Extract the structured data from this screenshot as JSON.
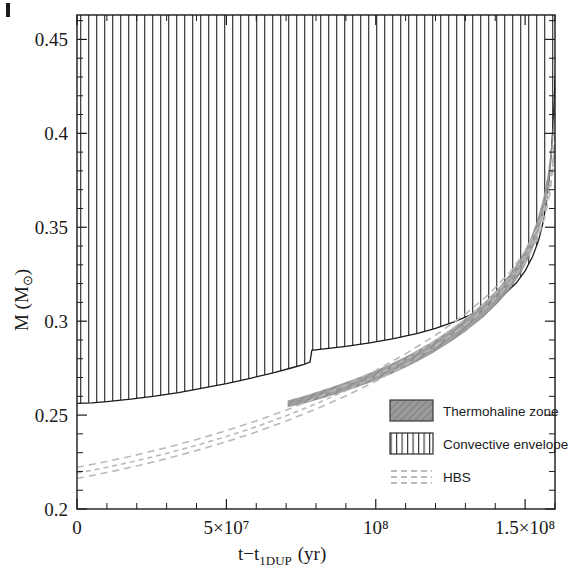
{
  "chart_data": {
    "type": "area",
    "title": "",
    "xlabel": "t-t_1DUP (yr)",
    "ylabel": "M (M_sun)",
    "xlim": [
      0,
      160000000
    ],
    "ylim": [
      0.2,
      0.463
    ],
    "grid": false,
    "legend_position": "inside-lower-right",
    "xticks": [
      {
        "value": 0,
        "label": "0"
      },
      {
        "value": 50000000,
        "label": "5×10⁷"
      },
      {
        "value": 100000000,
        "label": "10⁸"
      },
      {
        "value": 150000000,
        "label": "1.5×10⁸"
      }
    ],
    "xminor_step": 10000000,
    "yticks": [
      {
        "value": 0.2,
        "label": "0.2"
      },
      {
        "value": 0.25,
        "label": "0.25"
      },
      {
        "value": 0.3,
        "label": "0.3"
      },
      {
        "value": 0.35,
        "label": "0.35"
      },
      {
        "value": 0.4,
        "label": "0.4"
      },
      {
        "value": 0.45,
        "label": "0.45"
      }
    ],
    "yminor_step": 0.01,
    "series": [
      {
        "name": "Convective envelope",
        "kind": "hatched-region",
        "fill_pattern": "vertical-lines",
        "color": "#2b2b2b",
        "upper_value": 0.463,
        "lower_boundary": [
          [
            0,
            0.2562
          ],
          [
            5000000,
            0.2565
          ],
          [
            10000000,
            0.2572
          ],
          [
            18000000,
            0.2585
          ],
          [
            26000000,
            0.2601
          ],
          [
            34000000,
            0.262
          ],
          [
            42000000,
            0.2643
          ],
          [
            50000000,
            0.2668
          ],
          [
            58000000,
            0.2696
          ],
          [
            66000000,
            0.2726
          ],
          [
            72000000,
            0.2752
          ],
          [
            76000000,
            0.277
          ],
          [
            78000000,
            0.2782
          ],
          [
            78600000,
            0.2845
          ],
          [
            82000000,
            0.2851
          ],
          [
            90000000,
            0.2866
          ],
          [
            98000000,
            0.2884
          ],
          [
            106000000,
            0.2907
          ],
          [
            114000000,
            0.2935
          ],
          [
            120000000,
            0.2962
          ],
          [
            126000000,
            0.2995
          ],
          [
            132000000,
            0.3035
          ],
          [
            138000000,
            0.3086
          ],
          [
            143000000,
            0.3142
          ],
          [
            147000000,
            0.3203
          ],
          [
            150000000,
            0.3268
          ],
          [
            152500000,
            0.3344
          ],
          [
            154500000,
            0.343
          ],
          [
            156000000,
            0.3525
          ],
          [
            157200000,
            0.364
          ],
          [
            158100000,
            0.377
          ],
          [
            158800000,
            0.391
          ],
          [
            159400000,
            0.406
          ],
          [
            159800000,
            0.419
          ],
          [
            160000000,
            0.429
          ]
        ]
      },
      {
        "name": "Thermohaline zone",
        "kind": "band",
        "fill_pattern": "diagonal-hatch",
        "color": "#8c8c8c",
        "x_start": 70500000,
        "upper_boundary": [
          [
            70500000,
            0.2578
          ],
          [
            76000000,
            0.2602
          ],
          [
            82000000,
            0.2632
          ],
          [
            88000000,
            0.2664
          ],
          [
            94000000,
            0.2699
          ],
          [
            100000000,
            0.2737
          ],
          [
            106000000,
            0.278
          ],
          [
            112000000,
            0.2828
          ],
          [
            118000000,
            0.2882
          ],
          [
            124000000,
            0.2944
          ],
          [
            130000000,
            0.3014
          ],
          [
            136000000,
            0.3095
          ],
          [
            141000000,
            0.3175
          ],
          [
            145000000,
            0.3252
          ],
          [
            148500000,
            0.3336
          ],
          [
            151500000,
            0.343
          ],
          [
            154000000,
            0.3535
          ],
          [
            156000000,
            0.365
          ],
          [
            157500000,
            0.3775
          ],
          [
            158600000,
            0.391
          ],
          [
            159400000,
            0.405
          ],
          [
            160000000,
            0.42
          ]
        ],
        "lower_boundary": [
          [
            70500000,
            0.2542
          ],
          [
            76000000,
            0.2562
          ],
          [
            82000000,
            0.2588
          ],
          [
            88000000,
            0.2617
          ],
          [
            94000000,
            0.2649
          ],
          [
            100000000,
            0.2684
          ],
          [
            106000000,
            0.2724
          ],
          [
            112000000,
            0.2769
          ],
          [
            118000000,
            0.282
          ],
          [
            124000000,
            0.2878
          ],
          [
            130000000,
            0.2944
          ],
          [
            136000000,
            0.3021
          ],
          [
            141000000,
            0.3098
          ],
          [
            145000000,
            0.3172
          ],
          [
            148500000,
            0.3253
          ],
          [
            151500000,
            0.3344
          ],
          [
            154000000,
            0.3446
          ],
          [
            156000000,
            0.356
          ],
          [
            157500000,
            0.3684
          ],
          [
            158600000,
            0.3818
          ],
          [
            159400000,
            0.3958
          ],
          [
            160000000,
            0.411
          ]
        ]
      },
      {
        "name": "HBS",
        "kind": "dashed-lines",
        "color": "#b9b9b9",
        "lines": [
          {
            "id": "hbs-upper",
            "points": [
              [
                0,
                0.2222
              ],
              [
                10000000,
                0.2253
              ],
              [
                20000000,
                0.2288
              ],
              [
                30000000,
                0.2327
              ],
              [
                40000000,
                0.237
              ],
              [
                50000000,
                0.2417
              ],
              [
                60000000,
                0.2469
              ],
              [
                70000000,
                0.2526
              ],
              [
                80000000,
                0.259
              ],
              [
                90000000,
                0.266
              ],
              [
                100000000,
                0.2738
              ],
              [
                110000000,
                0.2826
              ],
              [
                120000000,
                0.2925
              ],
              [
                130000000,
                0.3038
              ],
              [
                138000000,
                0.3145
              ],
              [
                145000000,
                0.3262
              ],
              [
                150000000,
                0.3372
              ],
              [
                154000000,
                0.3492
              ],
              [
                156500000,
                0.3605
              ],
              [
                158200000,
                0.373
              ],
              [
                159300000,
                0.3862
              ],
              [
                160000000,
                0.399
              ]
            ]
          },
          {
            "id": "hbs-mid",
            "points": [
              [
                0,
                0.219
              ],
              [
                10000000,
                0.2222
              ],
              [
                20000000,
                0.2257
              ],
              [
                30000000,
                0.2296
              ],
              [
                40000000,
                0.2339
              ],
              [
                50000000,
                0.2386
              ],
              [
                60000000,
                0.2438
              ],
              [
                70000000,
                0.2496
              ],
              [
                80000000,
                0.256
              ],
              [
                90000000,
                0.263
              ],
              [
                100000000,
                0.2708
              ],
              [
                110000000,
                0.2796
              ],
              [
                120000000,
                0.2896
              ],
              [
                130000000,
                0.3009
              ],
              [
                138000000,
                0.3116
              ],
              [
                145000000,
                0.3233
              ],
              [
                150000000,
                0.3343
              ],
              [
                154000000,
                0.3463
              ],
              [
                156500000,
                0.3576
              ],
              [
                158200000,
                0.3701
              ],
              [
                159300000,
                0.3833
              ],
              [
                160000000,
                0.396
              ]
            ]
          },
          {
            "id": "hbs-lower",
            "points": [
              [
                0,
                0.2162
              ],
              [
                10000000,
                0.2194
              ],
              [
                20000000,
                0.2229
              ],
              [
                30000000,
                0.2268
              ],
              [
                40000000,
                0.2311
              ],
              [
                50000000,
                0.2358
              ],
              [
                60000000,
                0.241
              ],
              [
                70000000,
                0.2468
              ],
              [
                80000000,
                0.2532
              ],
              [
                90000000,
                0.2602
              ],
              [
                100000000,
                0.268
              ],
              [
                110000000,
                0.2768
              ],
              [
                120000000,
                0.2868
              ],
              [
                130000000,
                0.2981
              ],
              [
                138000000,
                0.3088
              ],
              [
                145000000,
                0.3205
              ],
              [
                150000000,
                0.3315
              ],
              [
                154000000,
                0.3435
              ],
              [
                156500000,
                0.3548
              ],
              [
                158200000,
                0.3673
              ],
              [
                159300000,
                0.3805
              ],
              [
                160000000,
                0.3932
              ]
            ]
          }
        ]
      }
    ],
    "legend": [
      {
        "label": "Thermohaline zone",
        "swatch": "diagonal-hatch"
      },
      {
        "label": "Convective envelope",
        "swatch": "vertical-lines"
      },
      {
        "label": "HBS",
        "swatch": "dashed-lines"
      }
    ]
  },
  "axis": {
    "xlabel_main": "t−t",
    "xlabel_sub": "1DUP",
    "xlabel_unit": "(yr)",
    "ylabel_main": "M (M",
    "ylabel_sub": "⊙",
    "ylabel_close": ")"
  },
  "colors": {
    "axis": "#1a1a1a",
    "thermohaline": "#8c8c8c",
    "convective": "#2b2b2b",
    "hbs": "#b9b9b9",
    "background": "#ffffff"
  }
}
